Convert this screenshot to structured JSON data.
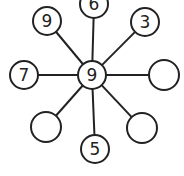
{
  "diagram": {
    "title": "",
    "center": {
      "label": "9",
      "x": 92,
      "y": 75,
      "r": 14
    },
    "nodes": [
      {
        "id": "top-left",
        "label": "9",
        "x": 47,
        "y": 21,
        "r": 14
      },
      {
        "id": "top",
        "label": "6",
        "x": 94,
        "y": 4,
        "r": 14
      },
      {
        "id": "top-right",
        "label": "3",
        "x": 145,
        "y": 22,
        "r": 14
      },
      {
        "id": "left",
        "label": "7",
        "x": 24,
        "y": 75,
        "r": 14
      },
      {
        "id": "right",
        "label": "",
        "x": 164,
        "y": 75,
        "r": 15
      },
      {
        "id": "bottom-left",
        "label": "",
        "x": 46,
        "y": 127,
        "r": 15
      },
      {
        "id": "bottom",
        "label": "5",
        "x": 95,
        "y": 149,
        "r": 14
      },
      {
        "id": "bottom-right",
        "label": "",
        "x": 142,
        "y": 128,
        "r": 15
      }
    ],
    "stroke_color": "#222222"
  }
}
